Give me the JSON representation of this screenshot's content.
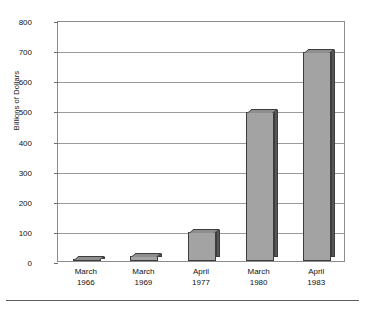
{
  "chart_data": {
    "type": "bar",
    "title": "",
    "subtitle": "",
    "xlabel": "",
    "ylabel": "Billions of Dollars",
    "categories": [
      "March 1966",
      "March 1969",
      "April 1977",
      "March 1980",
      "April 1983"
    ],
    "category_lines": [
      {
        "month": "March",
        "year": "1966"
      },
      {
        "month": "March",
        "year": "1969"
      },
      {
        "month": "April",
        "year": "1977"
      },
      {
        "month": "March",
        "year": "1980"
      },
      {
        "month": "April",
        "year": "1983"
      }
    ],
    "values": [
      8,
      18,
      95,
      493,
      693
    ],
    "ylim": [
      0,
      800
    ],
    "ytick_labels": [
      "800",
      "700",
      "600",
      "500",
      "400",
      "300",
      "200",
      "100",
      "0"
    ],
    "ytick_values": [
      800,
      700,
      600,
      500,
      400,
      300,
      200,
      100,
      0
    ],
    "grid": true,
    "legend": "none",
    "bar_color": "#a3a3a3",
    "bar_edge_color": "#3d3d3d",
    "bar_side_color": "#565656",
    "axis_color": "#8c8c8c",
    "gridline_color": "#9a9a9a",
    "background_color": "#ffffff"
  }
}
